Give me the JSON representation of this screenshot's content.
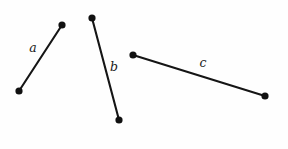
{
  "canvas": {
    "width": 288,
    "height": 149,
    "background_color": "#fefefe"
  },
  "style": {
    "line_color": "#151515",
    "line_width": 2.1,
    "dot_color": "#111111",
    "dot_radius": 3.6,
    "label_color": "#1a1a1a",
    "label_font_size": 12.5
  },
  "chart_data": {
    "type": "scatter",
    "title": "",
    "subtitle": "",
    "xlabel": "",
    "ylabel": "",
    "grid": false,
    "legend": "none",
    "xlim": [
      0,
      288
    ],
    "ylim": [
      149,
      0
    ],
    "segments": [
      {
        "name": "a",
        "label": "a",
        "x1": 19,
        "y1": 91,
        "x2": 62,
        "y2": 25,
        "label_x": 33,
        "label_y": 48
      },
      {
        "name": "b",
        "label": "b",
        "x1": 92,
        "y1": 18,
        "x2": 119,
        "y2": 120,
        "label_x": 114,
        "label_y": 67
      },
      {
        "name": "c",
        "label": "c",
        "x1": 133,
        "y1": 55,
        "x2": 265,
        "y2": 96,
        "label_x": 203,
        "label_y": 63
      }
    ]
  }
}
